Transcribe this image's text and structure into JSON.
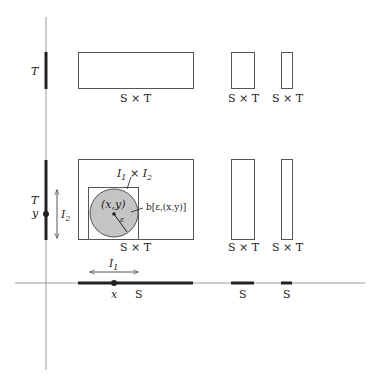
{
  "colors": {
    "axis": "#9a9a9a",
    "stroke": "#555555",
    "thick": "#222222",
    "disk_fill": "#c4c4c4",
    "text": "#222222"
  },
  "axes": {
    "vertical_axis_label_top": "T",
    "vertical_axis_label_mid": "T",
    "y_point_label": "y",
    "x_point_label": "x",
    "interval_I1": "I",
    "interval_I1_sub": "1",
    "interval_I2": "I",
    "interval_I2_sub": "2",
    "s_labels": [
      "S",
      "S",
      "S"
    ]
  },
  "top_row": {
    "rect_labels": [
      "S × T",
      "S × T",
      "S × T"
    ]
  },
  "middle_row": {
    "rect_labels": [
      "S × T",
      "S × T",
      "S × T"
    ],
    "product_label_a": "I",
    "product_label_a_sub": "1",
    "product_label_times": " × ",
    "product_label_b": "I",
    "product_label_b_sub": "2",
    "center_label": "(x,y)",
    "radius_label": "ε",
    "ball_label": "b[ε,(x,y)]"
  }
}
